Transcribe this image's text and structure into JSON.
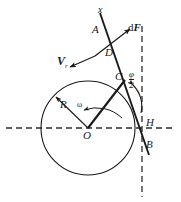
{
  "figure": {
    "type": "geometry-diagram",
    "background": "#ffffff",
    "stroke_color": "#1a1a1a",
    "dashed_color": "#333333",
    "labels": {
      "axis_x": "x",
      "point_A": "A",
      "point_D": "D",
      "point_C": "C",
      "point_O": "O",
      "point_H": "H",
      "point_B": "B",
      "radius": "R",
      "angular_velocity": "ω",
      "force_d": "d",
      "force_F": "F",
      "velocity_V": "V",
      "velocity_sub": "r",
      "angle_numerator": "φ",
      "angle_denominator": "2"
    },
    "geometry": {
      "circle": {
        "cx": 88,
        "cy": 128,
        "r": 47
      },
      "line_AB": {
        "x1": 101,
        "y1": 14,
        "x2": 148,
        "y2": 152
      },
      "vector_dF": {
        "x1": 92,
        "y1": 58,
        "x2": 131,
        "y2": 28
      },
      "vector_V": {
        "x1": 92,
        "y1": 58,
        "x2": 70,
        "y2": 66
      },
      "radius_OC": {
        "x1": 88,
        "y1": 128,
        "x2": 124,
        "y2": 79
      },
      "radius_R": {
        "x1": 88,
        "y1": 128,
        "x2": 55,
        "y2": 96
      },
      "horizontal_axis": {
        "x1": 6,
        "y1": 128,
        "x2": 176,
        "y2": 128
      },
      "vertical_axis": {
        "x1": 142,
        "y1": 28,
        "x2": 142,
        "y2": 196
      },
      "angle_arc_phi_half": {
        "cx": 128,
        "cy": 88,
        "r": 28
      },
      "angle_arc_omega": {
        "cx": 88,
        "cy": 128,
        "r": 36
      }
    }
  }
}
